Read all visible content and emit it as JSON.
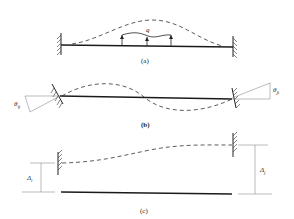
{
  "figure": {
    "panels": [
      {
        "id": "a",
        "caption": "(a)",
        "load_label": "q",
        "description": "Fixed-fixed beam under distributed load q with deflected shape"
      },
      {
        "id": "b",
        "caption": "(b)",
        "rotation_left_label": "θij",
        "rotation_right_label": "θji",
        "description": "Beam with end rotations"
      },
      {
        "id": "c",
        "caption": "(c)",
        "displacement_left_label": "Δi",
        "displacement_right_label": "Δj",
        "description": "Beam with end translations"
      }
    ],
    "labels": {
      "q": "q",
      "theta_ij_main": "θ",
      "theta_ij_sub": "ij",
      "theta_ji_main": "θ",
      "theta_ji_sub": "ji",
      "delta_i_main": "Δ",
      "delta_i_sub": "i",
      "delta_j_main": "Δ",
      "delta_j_sub": "j",
      "cap_a": "(a)",
      "cap_b": "(b)",
      "cap_c": "(c)"
    }
  }
}
